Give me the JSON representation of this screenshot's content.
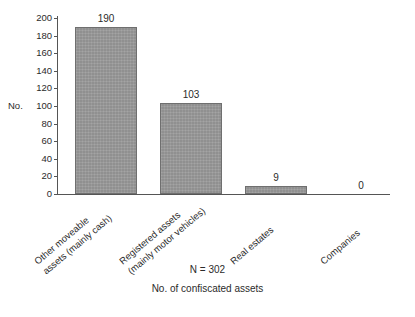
{
  "chart_data": {
    "type": "bar",
    "title": "",
    "xlabel": "No. of confiscated assets",
    "ylabel": "No.",
    "categories": [
      "Other moveable assets (mainly cash)",
      "Registered assets (mainly motor vehicles)",
      "Real estates",
      "Companies"
    ],
    "category_lines": [
      [
        "Other moveable",
        "assets (mainly cash)"
      ],
      [
        "Registered assets",
        "(mainly motor vehicles)"
      ],
      [
        "Real estates",
        ""
      ],
      [
        "Companies",
        ""
      ]
    ],
    "values": [
      190,
      103,
      9,
      0
    ],
    "value_labels": [
      "190",
      "103",
      "9",
      "0"
    ],
    "ylim": [
      0,
      200
    ],
    "yticks": [
      0,
      20,
      40,
      60,
      80,
      100,
      120,
      140,
      160,
      180,
      200
    ],
    "ytick_labels": [
      "0",
      "20",
      "40",
      "60",
      "80",
      "100",
      "120",
      "140",
      "160",
      "180",
      "200"
    ],
    "grid": false,
    "legend": "none",
    "bar_color": "#9b9b9b",
    "bar_edge_color": "#6f6f6f",
    "axis_color": "#555555",
    "annotations": {
      "sample_size": "N = 302"
    }
  },
  "axis": {
    "y_title": "No.",
    "y_title_tick_value": "100"
  },
  "footer": {
    "n_note": "N = 302",
    "x_title": "No. of confiscated assets"
  }
}
